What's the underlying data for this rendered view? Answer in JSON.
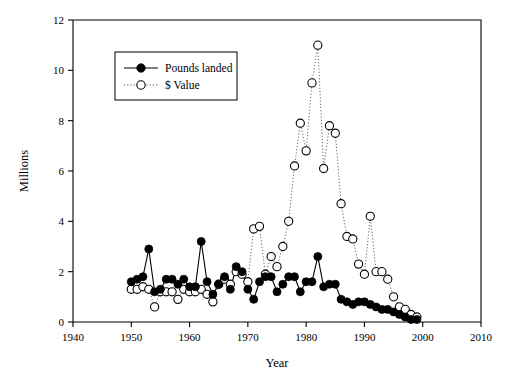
{
  "chart_data": {
    "type": "line",
    "title": "",
    "subtitle": "",
    "xlabel": "Year",
    "ylabel": "Millions",
    "xlim": [
      1940,
      2010
    ],
    "ylim": [
      0,
      12
    ],
    "xticks": [
      1940,
      1950,
      1960,
      1970,
      1980,
      1990,
      2000,
      2010
    ],
    "yticks": [
      0,
      2,
      4,
      6,
      8,
      10,
      12
    ],
    "grid": false,
    "legend_position": "upper-left-inside",
    "legend": [
      {
        "name": "Pounds landed",
        "marker": "filled-circle",
        "line": "solid"
      },
      {
        "name": "$ Value",
        "marker": "open-circle",
        "line": "dotted"
      }
    ],
    "x": [
      1950,
      1951,
      1952,
      1953,
      1954,
      1955,
      1956,
      1957,
      1958,
      1959,
      1960,
      1961,
      1962,
      1963,
      1964,
      1965,
      1966,
      1967,
      1968,
      1969,
      1970,
      1971,
      1972,
      1973,
      1974,
      1975,
      1976,
      1977,
      1978,
      1979,
      1980,
      1981,
      1982,
      1983,
      1984,
      1985,
      1986,
      1987,
      1988,
      1989,
      1990,
      1991,
      1992,
      1993,
      1994,
      1995,
      1996,
      1997,
      1998,
      1999
    ],
    "series": [
      {
        "name": "Pounds landed",
        "marker": "filled-circle",
        "line": "solid",
        "values": [
          1.6,
          1.7,
          1.8,
          2.9,
          1.2,
          1.3,
          1.7,
          1.7,
          1.5,
          1.7,
          1.4,
          1.4,
          3.2,
          1.6,
          1.1,
          1.5,
          1.8,
          1.3,
          2.2,
          2.0,
          1.3,
          0.9,
          1.6,
          1.8,
          1.8,
          1.2,
          1.5,
          1.8,
          1.8,
          1.2,
          1.6,
          1.6,
          2.6,
          1.4,
          1.5,
          1.5,
          0.9,
          0.8,
          0.7,
          0.8,
          0.8,
          0.7,
          0.6,
          0.5,
          0.5,
          0.4,
          0.3,
          0.2,
          0.1,
          0.1
        ]
      },
      {
        "name": "$ Value",
        "marker": "open-circle",
        "line": "dotted",
        "values": [
          1.3,
          1.3,
          1.4,
          1.3,
          0.6,
          1.2,
          1.2,
          1.2,
          0.9,
          1.3,
          1.2,
          1.2,
          1.3,
          1.1,
          0.8,
          1.5,
          1.7,
          1.5,
          2.0,
          1.9,
          1.6,
          3.7,
          3.8,
          1.9,
          2.6,
          2.2,
          3.0,
          4.0,
          6.2,
          7.9,
          6.8,
          9.5,
          11.0,
          6.1,
          7.8,
          7.5,
          4.7,
          3.4,
          3.3,
          2.3,
          1.9,
          4.2,
          2.0,
          2.0,
          1.7,
          1.0,
          0.6,
          0.5,
          0.3,
          0.2
        ]
      }
    ]
  },
  "axis": {
    "x_title": "Year",
    "y_title": "Millions",
    "x_tick_labels": [
      "1940",
      "1950",
      "1960",
      "1970",
      "1980",
      "1990",
      "2000",
      "2010"
    ],
    "y_tick_labels": [
      "0",
      "2",
      "4",
      "6",
      "8",
      "10",
      "12"
    ]
  },
  "legend": {
    "entry_1": "Pounds landed",
    "entry_2": "$ Value"
  },
  "colors": {
    "axis": "#000000",
    "series_pounds": "#000000",
    "series_value": "#555555",
    "background": "#ffffff"
  }
}
